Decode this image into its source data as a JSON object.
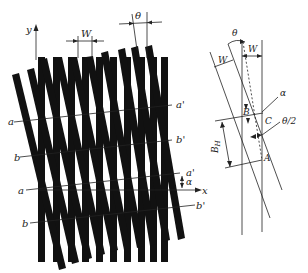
{
  "figure": {
    "main_diagram": {
      "axes": {
        "x_label": "x",
        "y_label": "y"
      },
      "top_dimensions": {
        "pitch_label": "W",
        "angle_label": "θ"
      },
      "grating_1": {
        "orientation": "vertical",
        "bar_count": 10,
        "color": "#111111"
      },
      "grating_2": {
        "orientation": "tilted",
        "bar_count": 10,
        "color": "#111111"
      },
      "fringe_lines": [
        {
          "left_label": "a",
          "right_label": "a'"
        },
        {
          "left_label": "b",
          "right_label": "b'"
        },
        {
          "left_label": "a",
          "right_label": "a'"
        },
        {
          "left_label": "b",
          "right_label": "b'"
        }
      ],
      "fringe_angle_label": "α"
    },
    "detail_diagram": {
      "angle_label": "θ",
      "pitch_label_tilted": "W",
      "pitch_label_vertical": "W",
      "points": [
        "B",
        "C",
        "A"
      ],
      "alpha_label": "α",
      "half_angle_label": "θ/2",
      "fringe_spacing_label": "B_H",
      "fringe_spacing_main": "B",
      "fringe_spacing_sub": "H"
    }
  }
}
